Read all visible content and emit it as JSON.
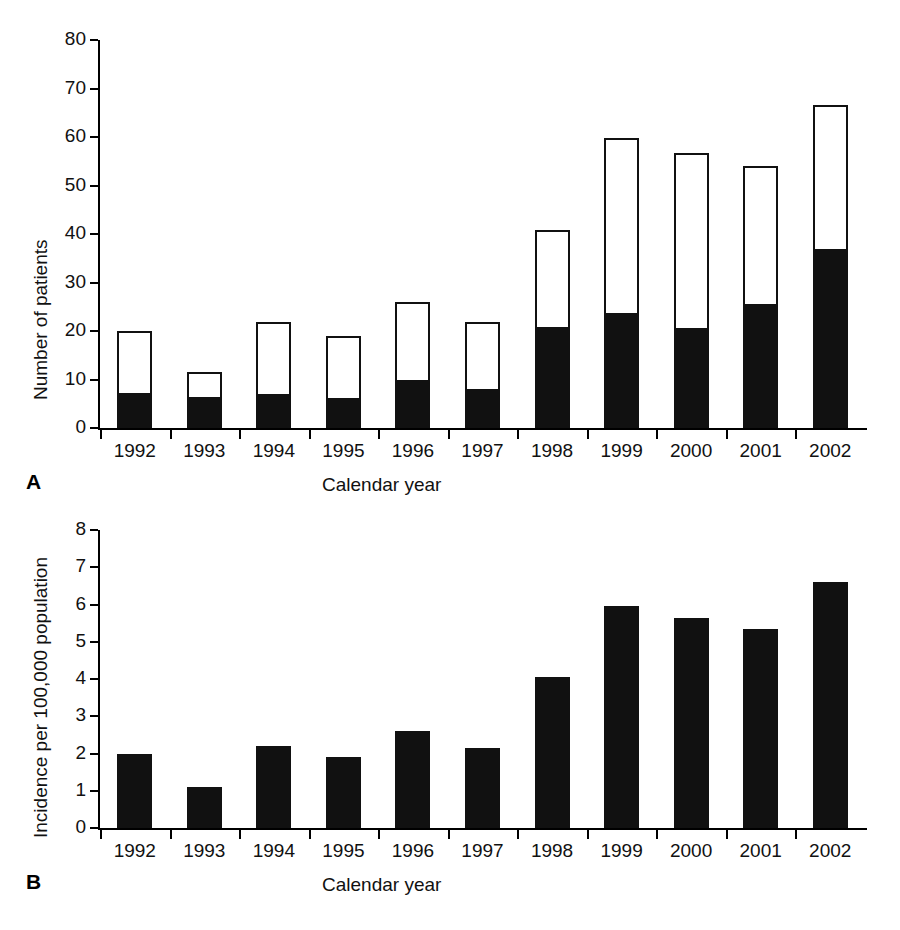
{
  "figure": {
    "panels": [
      {
        "letter": "A",
        "ylabel": "Number of patients",
        "xlabel": "Calendar year"
      },
      {
        "letter": "B",
        "ylabel": "Incidence per 100,000 population",
        "xlabel": "Calendar year"
      }
    ]
  },
  "chart_data": [
    {
      "type": "bar",
      "panel": "A",
      "stacked": true,
      "title": "",
      "xlabel": "Calendar year",
      "ylabel": "Number of patients",
      "ylim": [
        0,
        80
      ],
      "yticks": [
        0,
        10,
        20,
        30,
        40,
        50,
        60,
        70,
        80
      ],
      "ytick_labels": [
        "0",
        "10",
        "20",
        "30",
        "40",
        "50",
        "60",
        "70",
        "80"
      ],
      "grid": false,
      "legend": "none",
      "categories": [
        "1992",
        "1993",
        "1994",
        "1995",
        "1996",
        "1997",
        "1998",
        "1999",
        "2000",
        "2001",
        "2002"
      ],
      "series": [
        {
          "name": "filled-segment",
          "fill": "#111111",
          "values": [
            7.2,
            6.3,
            7.1,
            6.2,
            9.9,
            8.1,
            20.8,
            23.8,
            20.6,
            25.6,
            36.9
          ]
        },
        {
          "name": "open-segment",
          "fill": "#ffffff",
          "values": [
            12.8,
            5.2,
            14.8,
            12.8,
            16.1,
            13.7,
            20.1,
            36.0,
            36.0,
            28.4,
            29.7
          ]
        }
      ],
      "totals": [
        20.0,
        11.5,
        21.9,
        19.0,
        26.0,
        21.8,
        40.9,
        59.8,
        56.6,
        54.0,
        66.6
      ]
    },
    {
      "type": "bar",
      "panel": "B",
      "stacked": false,
      "title": "",
      "xlabel": "Calendar year",
      "ylabel": "Incidence per 100,000 population",
      "ylim": [
        0,
        8
      ],
      "yticks": [
        0,
        1,
        2,
        3,
        4,
        5,
        6,
        7,
        8
      ],
      "ytick_labels": [
        "0",
        "1",
        "2",
        "3",
        "4",
        "5",
        "6",
        "7",
        "8"
      ],
      "grid": false,
      "legend": "none",
      "categories": [
        "1992",
        "1993",
        "1994",
        "1995",
        "1996",
        "1997",
        "1998",
        "1999",
        "2000",
        "2001",
        "2002"
      ],
      "values": [
        2.0,
        1.1,
        2.2,
        1.9,
        2.6,
        2.15,
        4.05,
        5.95,
        5.65,
        5.35,
        6.6
      ]
    }
  ]
}
